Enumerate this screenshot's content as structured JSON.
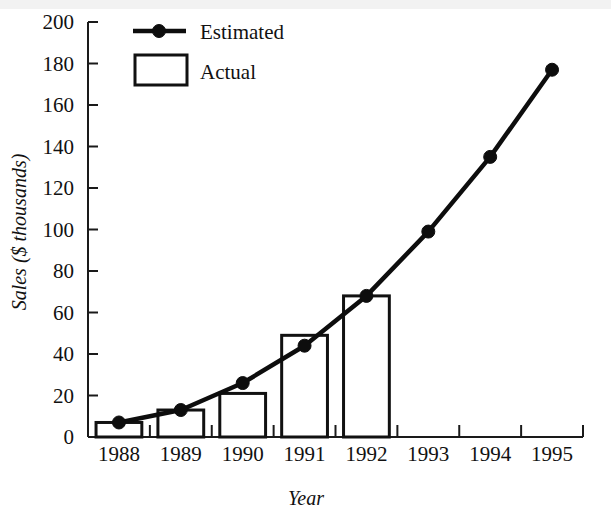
{
  "chart_data": {
    "type": "bar",
    "title": "",
    "subtitle": "",
    "xlabel": "Year",
    "ylabel": "Sales ($ thousands)",
    "categories": [
      "1988",
      "1989",
      "1990",
      "1991",
      "1992",
      "1993",
      "1994",
      "1995"
    ],
    "ylim": [
      0,
      200
    ],
    "ytick_step": 20,
    "ytick_labels": [
      "0",
      "20",
      "40",
      "60",
      "80",
      "100",
      "120",
      "140",
      "160",
      "180",
      "200"
    ],
    "ytick_values": [
      0,
      20,
      40,
      60,
      80,
      100,
      120,
      140,
      160,
      180,
      200
    ],
    "grid": false,
    "legend_position": "top-left-inside",
    "series": [
      {
        "name": "Estimated",
        "type": "line",
        "marker": "filled-circle",
        "color": "#0d0d0d",
        "x": [
          "1988",
          "1989",
          "1990",
          "1991",
          "1992",
          "1993",
          "1994",
          "1995"
        ],
        "values": [
          7,
          13,
          26,
          44,
          68,
          99,
          135,
          177
        ]
      },
      {
        "name": "Actual",
        "type": "bar",
        "color": "#ffffff",
        "edge_color": "#111111",
        "x": [
          "1988",
          "1989",
          "1990",
          "1991",
          "1992"
        ],
        "values": [
          7,
          13,
          21,
          49,
          68
        ]
      }
    ]
  },
  "legend": {
    "items": [
      {
        "label": "Estimated",
        "marker": "line-with-point"
      },
      {
        "label": "Actual",
        "marker": "open-rectangle"
      }
    ]
  },
  "axes": {
    "y_title": "Sales ($ thousands)",
    "x_title": "Year"
  },
  "colors": {
    "ink": "#111111",
    "line": "#0d0d0d",
    "bar_fill": "#ffffff",
    "background": "#ffffff"
  }
}
